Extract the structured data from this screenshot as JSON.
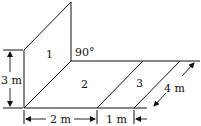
{
  "diagram": {
    "panels": [
      {
        "id": "1",
        "label": "1"
      },
      {
        "id": "2",
        "label": "2"
      },
      {
        "id": "3",
        "label": "3"
      }
    ],
    "angle_label": "90°",
    "dimensions": {
      "height": "3 m",
      "width_panel2": "2 m",
      "width_panel3": "1 m",
      "depth": "4 m"
    },
    "colors": {
      "line": "#111111",
      "background": "#ffffff"
    }
  }
}
